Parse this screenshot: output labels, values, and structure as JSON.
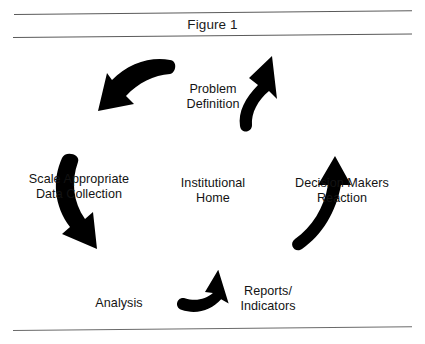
{
  "figure": {
    "title": "Figure 1",
    "center_label": "Institutional\nHome",
    "flow_direction": "counterclockwise",
    "ink_color": "#000000",
    "rule_color": "#5a5a5a",
    "background_color": "#ffffff",
    "nodes": [
      {
        "id": "problem-definition",
        "label": "Problem\nDefinition",
        "position": "top"
      },
      {
        "id": "decision-makers",
        "label": "Decision Makers\nReaction",
        "position": "right"
      },
      {
        "id": "reports-indicators",
        "label": "Reports/\nIndicators",
        "position": "bottom-right"
      },
      {
        "id": "analysis",
        "label": "Analysis",
        "position": "bottom-left"
      },
      {
        "id": "scale-data",
        "label": "Scale Appropriate\nData Collection",
        "position": "left"
      }
    ],
    "arrows": [
      {
        "id": "arrow-top-left",
        "from": "problem-definition",
        "to": "scale-data",
        "points": "down-left"
      },
      {
        "id": "arrow-left",
        "from": "scale-data",
        "to": "analysis",
        "points": "down-right"
      },
      {
        "id": "arrow-bottom",
        "from": "analysis",
        "to": "reports-indicators",
        "points": "right"
      },
      {
        "id": "arrow-right",
        "from": "reports-indicators",
        "to": "decision-makers",
        "points": "up"
      },
      {
        "id": "arrow-top-right",
        "from": "decision-makers",
        "to": "problem-definition",
        "points": "up-left"
      }
    ]
  }
}
